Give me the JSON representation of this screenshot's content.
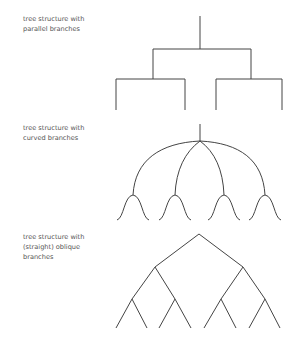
{
  "diagrams": [
    {
      "id": "parallel",
      "label_lines": [
        "tree structure with",
        "parallel branches"
      ]
    },
    {
      "id": "curved",
      "label_lines": [
        "tree structure with",
        "curved branches"
      ]
    },
    {
      "id": "oblique",
      "label_lines": [
        "tree structure with",
        "(straight) oblique",
        "branches"
      ]
    }
  ],
  "colors": {
    "line": "#444444",
    "text": "#555555",
    "background": "#ffffff"
  }
}
